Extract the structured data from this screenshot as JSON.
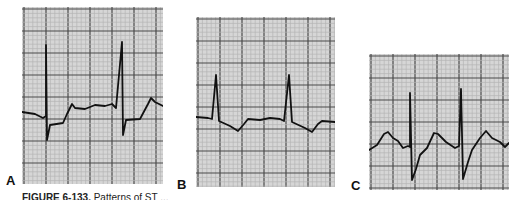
{
  "figure": {
    "caption_prefix": "FIGURE 6-133.",
    "caption_text": "Patterns of ST ...",
    "panels": [
      {
        "label": "A",
        "x": 22,
        "y": 7,
        "w": 141,
        "h": 177,
        "trace": "22,112 35,114 43,118 46,116 46,45 47,140 50,125 63,123 67,114 72,104 75,108 85,109 95,105 105,106 112,104 116,108 122,42 123,135 126,120 140,119 148,104 151,98 155,102 163,106"
      },
      {
        "label": "B",
        "x": 196,
        "y": 17,
        "w": 139,
        "h": 170,
        "trace": "196,117 208,118 212,119 216,75 219,121 230,126 238,131 244,124 248,119 260,120 270,118 280,119 284,121 289,75 292,122 305,128 312,132 318,124 322,121 335,122"
      },
      {
        "label": "C",
        "x": 369,
        "y": 54,
        "w": 140,
        "h": 136,
        "trace": "369,150 377,145 384,134 388,132 393,138 398,141 403,148 408,146 410,147 410,93 412,180 416,169 420,155 427,148 434,133 438,134 446,142 455,148 459,146 461,89 463,179 468,162 472,150 480,138 486,131 492,138 500,142 505,147 509,143"
      }
    ],
    "label_positions": [
      {
        "label": "A",
        "left": 6,
        "top": 174
      },
      {
        "label": "B",
        "left": 177,
        "top": 178
      },
      {
        "label": "C",
        "left": 351,
        "top": 179
      }
    ],
    "colors": {
      "paper": "#d6d6d6",
      "minor_grid": "#b4b4b4",
      "major_grid": "#4a4a4a",
      "trace": "#111111"
    }
  }
}
